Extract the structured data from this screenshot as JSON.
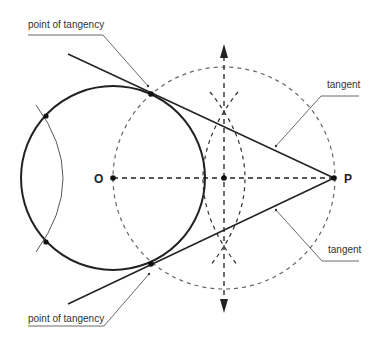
{
  "diagram": {
    "labels": {
      "point_of_tangency_top": "point of tangency",
      "point_of_tangency_bottom": "point of tangency",
      "tangent_top": "tangent",
      "tangent_bottom": "tangent",
      "center": "O",
      "external_point": "P"
    },
    "colors": {
      "stroke": "#222222",
      "dashed": "#555555",
      "leader": "#444444"
    },
    "geometry": {
      "circle_center": [
        113,
        178
      ],
      "circle_radius": 92,
      "external_point": [
        334,
        178
      ],
      "midpoint": [
        224,
        178
      ],
      "construction_circle_radius": 111,
      "tangency_points": [
        [
          151,
          94
        ],
        [
          151,
          264
        ]
      ]
    }
  }
}
